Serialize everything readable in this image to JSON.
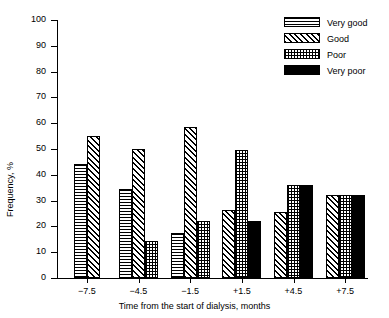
{
  "chart_data": {
    "type": "bar",
    "title": "",
    "xlabel": "Time from the start of dialysis, months",
    "ylabel": "Frequency, %",
    "categories": [
      "−7.5",
      "−4.5",
      "−1.5",
      "+1.5",
      "+4.5",
      "+7.5"
    ],
    "series": [
      {
        "name": "Very good",
        "pattern": "horizontal-lines",
        "values": [
          44,
          34.5,
          17.5,
          null,
          null,
          null
        ]
      },
      {
        "name": "Good",
        "pattern": "diagonal-hatch",
        "values": [
          55,
          50,
          58.5,
          26.5,
          25.5,
          32
        ]
      },
      {
        "name": "Poor",
        "pattern": "stipple-dots",
        "values": [
          null,
          14.5,
          22,
          49.5,
          36,
          32
        ]
      },
      {
        "name": "Very poor",
        "pattern": "solid-black",
        "values": [
          null,
          null,
          null,
          22,
          36,
          32
        ]
      }
    ],
    "ylim": [
      0,
      100
    ],
    "ytick_values": [
      0,
      10,
      20,
      30,
      40,
      50,
      60,
      70,
      80,
      90,
      100
    ],
    "ytick_labels": [
      "0",
      "10",
      "20",
      "30",
      "40",
      "50",
      "60",
      "70",
      "80",
      "90",
      "100"
    ],
    "grid": false,
    "legend_position": "top-right",
    "legend_entries": [
      "Very good",
      "Good",
      "Poor",
      "Very poor"
    ]
  },
  "axes": {
    "ylabel": "Frequency, %",
    "xlabel": "Time from the start of dialysis, months"
  },
  "colors": {
    "foreground": "#000000",
    "background": "#ffffff"
  }
}
